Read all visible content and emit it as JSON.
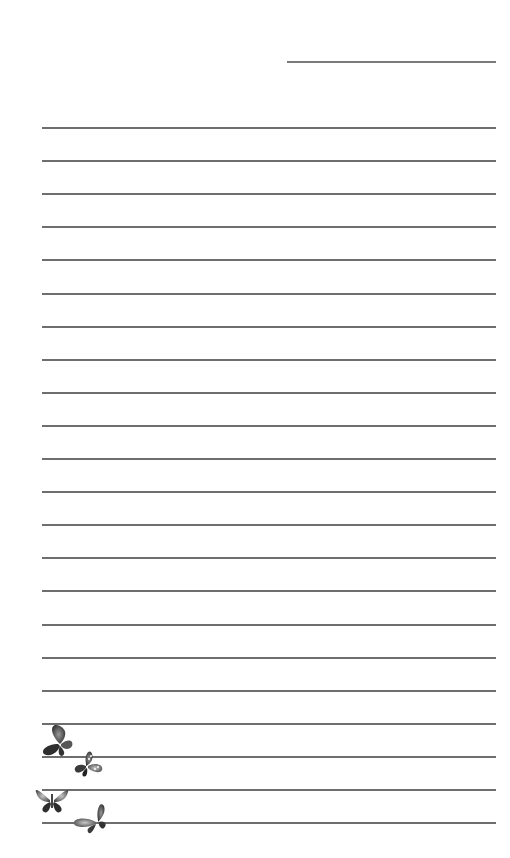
{
  "page": {
    "type": "lined stationery",
    "background": "#ffffff",
    "line_color": "#6e6e6e",
    "date_line": {
      "left": 287,
      "top": 61,
      "width": 209
    },
    "ruled_lines": {
      "count": 22,
      "left": 42,
      "width": 454,
      "first_top": 127,
      "spacing": 33.1
    },
    "decoration": {
      "icon": "butterflies-icon",
      "count": 4
    }
  }
}
